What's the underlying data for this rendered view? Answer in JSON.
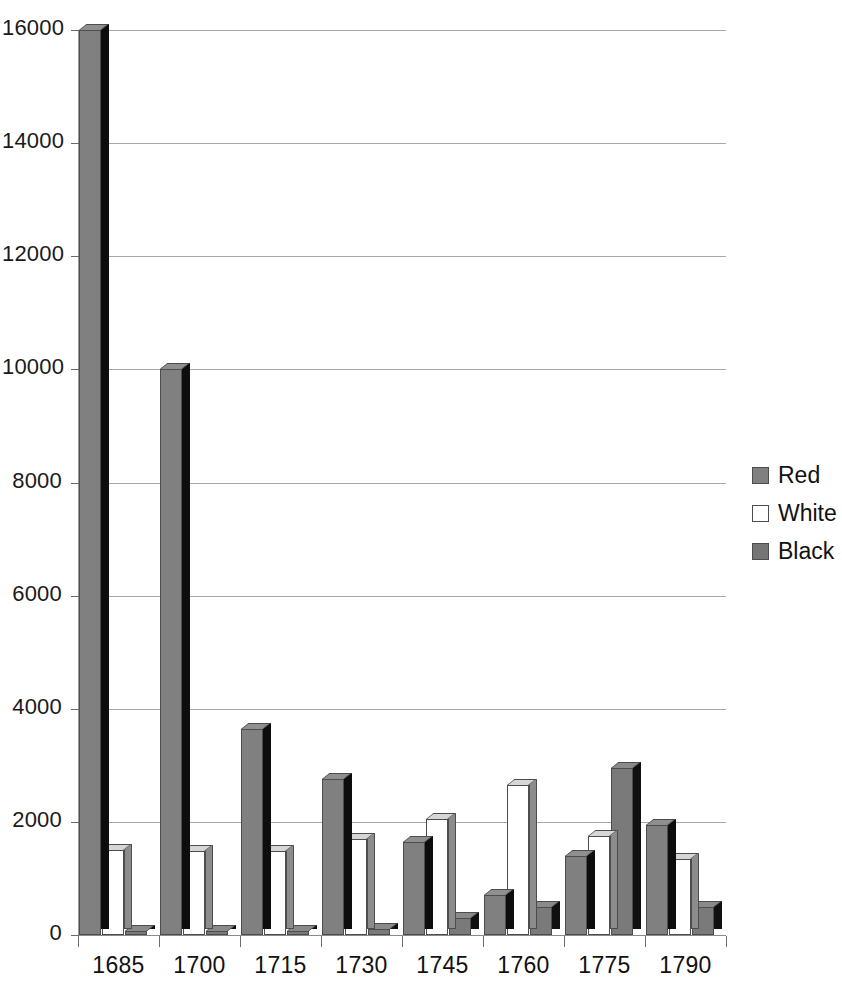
{
  "chart_data": {
    "type": "bar",
    "title": "",
    "subtitle": "",
    "xlabel": "",
    "ylabel": "",
    "categories": [
      "1685",
      "1700",
      "1715",
      "1730",
      "1745",
      "1760",
      "1775",
      "1790"
    ],
    "series": [
      {
        "name": "Red",
        "color": "#808080",
        "values": [
          16000,
          10000,
          3650,
          2750,
          1650,
          700,
          1400,
          1950
        ]
      },
      {
        "name": "White",
        "color": "#ffffff",
        "values": [
          1500,
          1480,
          1480,
          1700,
          2050,
          2650,
          1750,
          1350
        ]
      },
      {
        "name": "Black",
        "color": "#757575",
        "values": [
          40,
          40,
          40,
          100,
          300,
          500,
          2950,
          500
        ]
      }
    ],
    "ylim": [
      0,
      16000
    ],
    "ytick_values": [
      0,
      2000,
      4000,
      6000,
      8000,
      10000,
      12000,
      14000,
      16000
    ],
    "ytick_labels": [
      "0",
      "2000",
      "4000",
      "6000",
      "8000",
      "10000",
      "12000",
      "14000",
      "16000"
    ],
    "grid": true,
    "grid_axis": "y",
    "legend_position": "right",
    "style": "3d-column",
    "background": "#ffffff"
  },
  "legend": {
    "entries": [
      {
        "label": "Red",
        "swatch": "swatch-red"
      },
      {
        "label": "White",
        "swatch": "swatch-white"
      },
      {
        "label": "Black",
        "swatch": "swatch-black"
      }
    ]
  }
}
